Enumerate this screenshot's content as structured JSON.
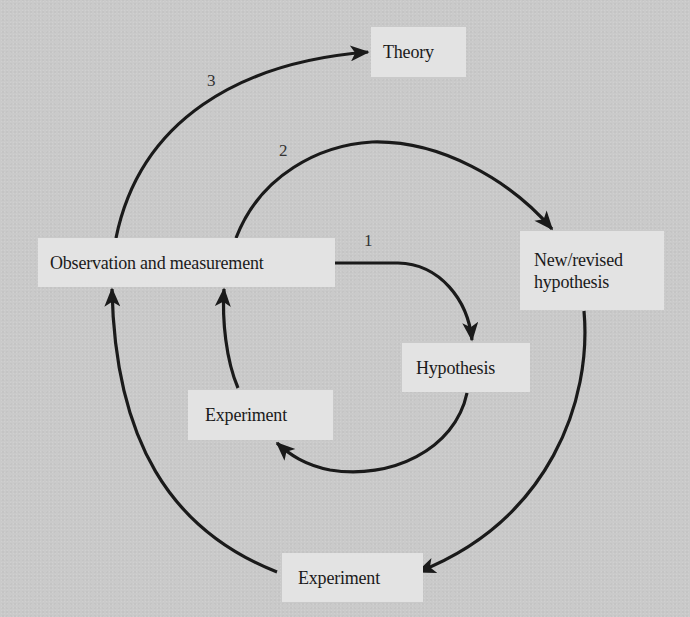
{
  "diagram": {
    "type": "spiral-cycle",
    "nodes": {
      "observation": {
        "label": "Observation and measurement"
      },
      "theory": {
        "label": "Theory"
      },
      "new_hypothesis": {
        "label": "New/revised\nhypothesis"
      },
      "hypothesis": {
        "label": "Hypothesis"
      },
      "experiment_inner": {
        "label": "Experiment"
      },
      "experiment_outer": {
        "label": "Experiment"
      }
    },
    "loop_labels": {
      "loop1": "1",
      "loop2": "2",
      "loop3": "3"
    },
    "edges": [
      {
        "loop": "1",
        "from": "Observation and measurement",
        "to": "Hypothesis"
      },
      {
        "loop": "1",
        "from": "Hypothesis",
        "to": "Experiment"
      },
      {
        "loop": "1",
        "from": "Experiment",
        "to": "Observation and measurement"
      },
      {
        "loop": "2",
        "from": "Observation and measurement",
        "to": "New/revised hypothesis"
      },
      {
        "loop": "2",
        "from": "New/revised hypothesis",
        "to": "Experiment"
      },
      {
        "loop": "2",
        "from": "Experiment",
        "to": "Observation and measurement"
      },
      {
        "loop": "3",
        "from": "Observation and measurement",
        "to": "Theory"
      }
    ],
    "colors": {
      "background": "#cacaca",
      "box": "#e3e3e3",
      "stroke": "#1a1a1a",
      "text": "#1a1a1a"
    }
  }
}
